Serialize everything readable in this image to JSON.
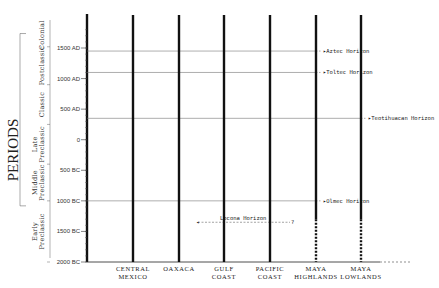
{
  "title": "PERIODS",
  "time_axis": {
    "ticks": [
      {
        "label": "1500 AD",
        "year": 1500
      },
      {
        "label": "1000 AD",
        "year": 1000
      },
      {
        "label": "500 AD",
        "year": 500
      },
      {
        "label": "0",
        "year": 0
      },
      {
        "label": "500 BC",
        "year": -500
      },
      {
        "label": "1000 BC",
        "year": -1000
      },
      {
        "label": "1500 BC",
        "year": -1500
      },
      {
        "label": "2000 BC",
        "year": -2000
      }
    ],
    "range": [
      -2000,
      1900
    ]
  },
  "periods": [
    {
      "label": "Colonial",
      "start": 1520,
      "end": 1900
    },
    {
      "label": "Postclassic",
      "start": 900,
      "end": 1520
    },
    {
      "label": "Classic",
      "start": 250,
      "end": 900
    },
    {
      "label": "Late Preclassic",
      "start": -400,
      "end": 250
    },
    {
      "label": "Middle Preclassic",
      "start": -1000,
      "end": -400
    },
    {
      "label": "Early Preclassic",
      "start": -2000,
      "end": -1000
    }
  ],
  "regions": [
    {
      "line1": "CENTRAL",
      "line2": "MEXICO",
      "dashed_bottom": false
    },
    {
      "line1": "OAXACA",
      "line2": "",
      "dashed_bottom": false
    },
    {
      "line1": "GULF",
      "line2": "COAST",
      "dashed_bottom": false
    },
    {
      "line1": "PACIFIC",
      "line2": "COAST",
      "dashed_bottom": false
    },
    {
      "line1": "MAYA",
      "line2": "HIGHLANDS",
      "dashed_bottom": true
    },
    {
      "line1": "MAYA",
      "line2": "LOWLANDS",
      "dashed_bottom": true
    }
  ],
  "horizons": [
    {
      "label": "Aztec Horizon",
      "year": 1450
    },
    {
      "label": "Toltec Horizon",
      "year": 1100
    },
    {
      "label": "Teotihuacan Horizon",
      "year": 350
    },
    {
      "label": "Olmec Horizon",
      "year": -1000
    }
  ],
  "locona": {
    "label": "Locona Horizon",
    "year": -1350,
    "end_mark": "?"
  }
}
